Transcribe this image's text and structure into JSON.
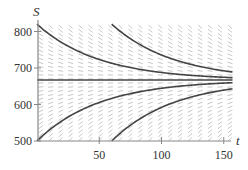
{
  "chart_data": {
    "type": "line",
    "title": "",
    "xlabel": "t",
    "ylabel": "S",
    "xlim": [
      0,
      157
    ],
    "ylim": [
      500,
      825
    ],
    "xticks": [
      50,
      100,
      150
    ],
    "yticks": [
      500,
      600,
      700,
      800
    ],
    "grid": false,
    "background": "direction field",
    "equilibrium": 667,
    "decay_rate": 0.02,
    "series": [
      {
        "name": "solution-upper-t0",
        "start": [
          0,
          820
        ]
      },
      {
        "name": "solution-upper-t60",
        "start": [
          60,
          820
        ]
      },
      {
        "name": "equilibrium",
        "start": [
          0,
          667
        ]
      },
      {
        "name": "solution-lower-t0",
        "start": [
          0,
          500
        ]
      },
      {
        "name": "solution-lower-t60",
        "start": [
          60,
          500
        ]
      }
    ],
    "colors": {
      "curve": "#444444",
      "axis": "#888888",
      "field": "#c8c8c8"
    }
  }
}
